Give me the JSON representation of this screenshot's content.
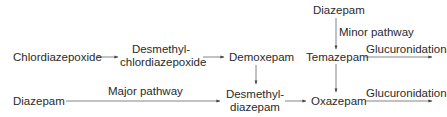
{
  "diagram": {
    "nodes": {
      "chlordiazepoxide": "Chlordiazepoxide",
      "desmethylchlordiazepoxide_line1": "Desmethyl-",
      "desmethylchlordiazepoxide_line2": "chlordiazepoxide",
      "demoxepam": "Demoxepam",
      "diazepam_top": "Diazepam",
      "temazepam": "Temazepam",
      "diazepam_bottom": "Diazepam",
      "desmethyldiazepam_line1": "Desmethyl-",
      "desmethyldiazepam_line2": "diazepam",
      "oxazepam": "Oxazepam"
    },
    "edge_labels": {
      "minor_pathway": "Minor pathway",
      "major_pathway": "Major pathway",
      "glucuronidation_temazepam": "Glucuronidation",
      "glucuronidation_oxazepam": "Glucuronidation"
    },
    "edges": [
      {
        "from": "Chlordiazepoxide",
        "to": "Desmethylchlordiazepoxide"
      },
      {
        "from": "Desmethylchlordiazepoxide",
        "to": "Demoxepam"
      },
      {
        "from": "Demoxepam",
        "to": "Desmethyldiazepam"
      },
      {
        "from": "Diazepam",
        "to": "Desmethyldiazepam",
        "label": "Major pathway"
      },
      {
        "from": "Desmethyldiazepam",
        "to": "Oxazepam"
      },
      {
        "from": "Diazepam",
        "to": "Temazepam",
        "label": "Minor pathway"
      },
      {
        "from": "Temazepam",
        "to": "Oxazepam"
      },
      {
        "from": "Temazepam",
        "to": "(excreted)",
        "label": "Glucuronidation"
      },
      {
        "from": "Oxazepam",
        "to": "(excreted)",
        "label": "Glucuronidation"
      }
    ],
    "colors": {
      "text": "#2a2a2a",
      "line": "#555555",
      "background": "#ffffff"
    }
  }
}
